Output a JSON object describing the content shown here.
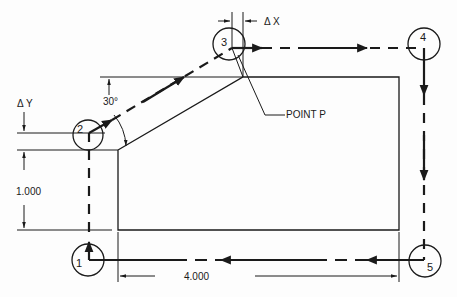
{
  "diagram": {
    "type": "cnc-tool-path",
    "colors": {
      "ink": "#1a1a1a",
      "background": "#fdfdfd"
    },
    "points": [
      {
        "id": "1",
        "label": "1"
      },
      {
        "id": "2",
        "label": "2"
      },
      {
        "id": "3",
        "label": "3"
      },
      {
        "id": "4",
        "label": "4"
      },
      {
        "id": "5",
        "label": "5"
      }
    ],
    "annotations": {
      "delta_x": "Δ X",
      "delta_y": "Δ Y",
      "angle": "30°",
      "point_p": "POINT P",
      "height_dim": "1.000",
      "width_dim": "4.000"
    }
  }
}
